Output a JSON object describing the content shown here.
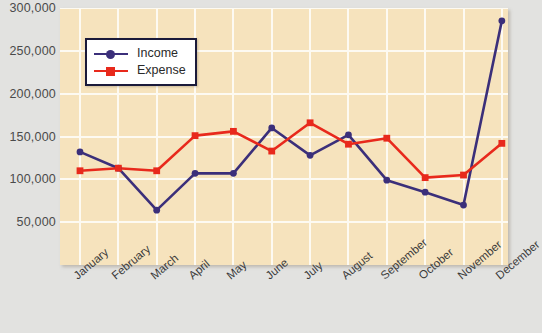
{
  "chart_data": {
    "type": "line",
    "title": "",
    "xlabel": "",
    "ylabel": "",
    "categories": [
      "January",
      "February",
      "March",
      "April",
      "May",
      "June",
      "July",
      "August",
      "September",
      "October",
      "November",
      "December"
    ],
    "series": [
      {
        "name": "Income",
        "color": "#3b2f7a",
        "marker": "circle",
        "values": [
          132000,
          113000,
          64000,
          107000,
          107000,
          160000,
          128000,
          152000,
          99000,
          85000,
          70000,
          285000
        ]
      },
      {
        "name": "Expense",
        "color": "#e8291c",
        "marker": "square",
        "values": [
          110000,
          113000,
          110000,
          151000,
          156000,
          133000,
          166000,
          141000,
          148000,
          102000,
          105000,
          142000
        ]
      }
    ],
    "ylim": [
      0,
      300000
    ],
    "ytick_values": [
      300000,
      250000,
      200000,
      150000,
      100000,
      50000
    ],
    "ytick_labels": [
      "300,000",
      "250,000",
      "200,000",
      "150,000",
      "100,000",
      "50,000"
    ],
    "grid": true,
    "legend_position": "top-left",
    "plot_background": "#f6e3bd",
    "gridline_color": "#fdfaf2",
    "page_background": "#e2e2e0"
  }
}
